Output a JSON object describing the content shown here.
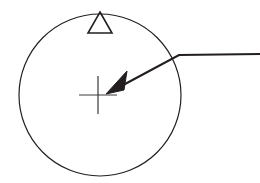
{
  "figure": {
    "title": "",
    "caption": "",
    "background_color": "#ffffff",
    "width": 260,
    "height": 183
  },
  "chart_data": {
    "type": "diagram",
    "title": "",
    "description": "Line drawing: large circle with a small open triangle marker resting on the top of the circle, a crosshair (plus) mark near the circle centre, and a bent leader line with a solid arrowhead pointing from the right edge to the crosshair.",
    "elements": [
      {
        "id": "circle",
        "name": "circle-outline",
        "shape": "circle",
        "cx": 100,
        "cy": 95,
        "r": 81,
        "stroke": "#231f20",
        "stroke_width": 1.2,
        "fill": "none"
      },
      {
        "id": "triangle",
        "name": "triangle-marker",
        "shape": "polygon",
        "points": "100,12 112,33 88,33",
        "stroke": "#231f20",
        "stroke_width": 1.6,
        "fill": "none"
      },
      {
        "id": "crosshair",
        "name": "crosshair-mark",
        "shape": "cross",
        "cx": 98,
        "cy": 95,
        "half_width": 19,
        "half_height": 19,
        "stroke": "#3a3a3a",
        "stroke_width": 1.2
      },
      {
        "id": "leader",
        "name": "leader-line",
        "shape": "polyline",
        "points": "260,54 179,55 112,91",
        "stroke": "#231f20",
        "stroke_width": 2.2,
        "fill": "none"
      },
      {
        "id": "arrowhead",
        "name": "arrowhead",
        "shape": "polygon",
        "points": "106,94 126,72 124,89",
        "stroke": "#231f20",
        "stroke_width": 1,
        "fill": "#231f20"
      }
    ],
    "colors": {
      "stroke": "#231f20",
      "crosshair_stroke": "#3a3a3a",
      "background": "#ffffff"
    },
    "labels": [],
    "annotations": []
  }
}
